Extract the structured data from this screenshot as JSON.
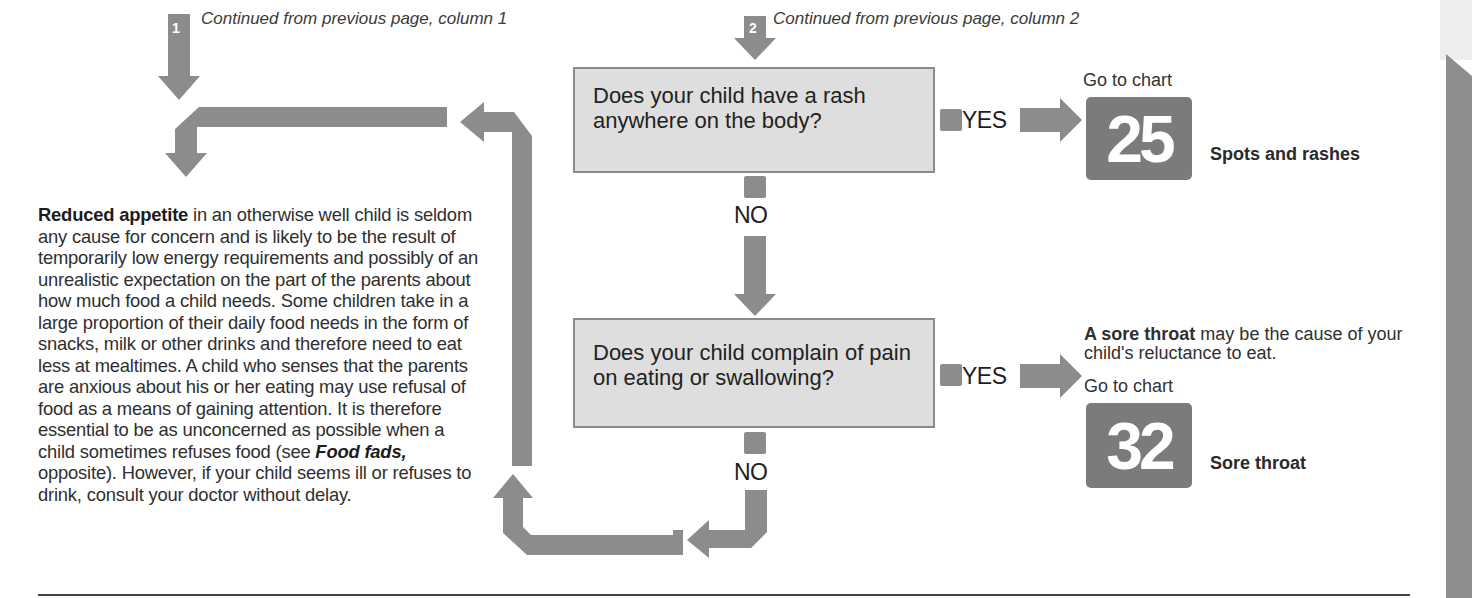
{
  "connectors": {
    "col1": {
      "badge": "1",
      "text": "Continued from previous page, column 1"
    },
    "col2": {
      "badge": "2",
      "text": "Continued from previous page, column 2"
    }
  },
  "questions": [
    {
      "text": "Does your child have a rash anywhere on the body?",
      "yes_label": "YES",
      "no_label": "NO",
      "outcome": {
        "note_bold": "",
        "note_rest": "",
        "goto_label": "Go to chart",
        "chart_number": "25",
        "chart_name": "Spots and rashes"
      }
    },
    {
      "text": "Does your child complain of pain on eating or swallowing?",
      "yes_label": "YES",
      "no_label": "NO",
      "outcome": {
        "note_bold": "A sore throat",
        "note_rest": " may be the cause of your child's reluctance to eat.",
        "goto_label": "Go to chart",
        "chart_number": "32",
        "chart_name": "Sore throat"
      }
    }
  ],
  "conclusion": {
    "bold_lead": "Reduced appetite",
    "text_1": " in an otherwise well child is seldom any cause for concern and is likely to be the result of temporarily low energy requirements and possibly of an unrealistic expectation on the part of the parents about how much food a child needs. Some children take in a large proportion of their daily food needs in the form of snacks, milk or other drinks and therefore need to eat less at mealtimes. A child who senses that the parents are anxious about his or her eating may use refusal of food as a means of gaining attention. It is therefore essential to be as unconcerned as possible when a child sometimes refuses food (see ",
    "italic_ref": "Food fads,",
    "text_2": " opposite). However, if your child seems ill or refuses to drink, consult your doctor without delay."
  },
  "colors": {
    "arrow": "#8a8a8a",
    "question_box": "#dedede",
    "chart_badge": "#7b7b7b"
  }
}
